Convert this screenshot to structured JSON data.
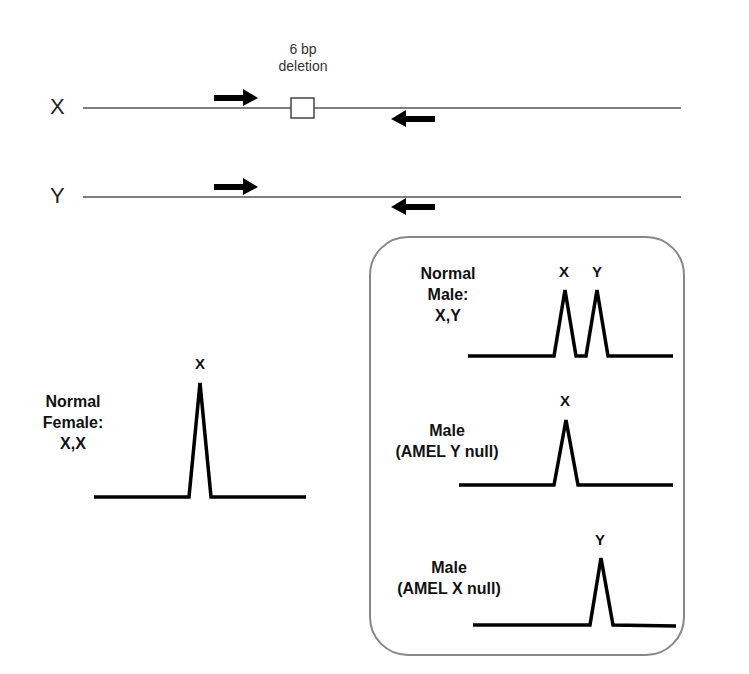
{
  "diagram": {
    "chromosomes": [
      {
        "label": "X",
        "has_deletion": true
      },
      {
        "label": "Y",
        "has_deletion": false
      }
    ],
    "deletion_label_line1": "6 bp",
    "deletion_label_line2": "deletion",
    "female": {
      "line1": "Normal",
      "line2": "Female:",
      "line3": "X,X",
      "peaks": [
        "X"
      ]
    },
    "panel": {
      "normal_male": {
        "line1": "Normal",
        "line2": "Male:",
        "line3": "X,Y",
        "peaks": [
          "X",
          "Y"
        ]
      },
      "y_null": {
        "line1": "Male",
        "line2": "(AMEL Y null)",
        "peaks": [
          "X"
        ]
      },
      "x_null": {
        "line1": "Male",
        "line2": "(AMEL X null)",
        "peaks": [
          "Y"
        ]
      }
    },
    "colors": {
      "line": "#555555",
      "ink": "#000000",
      "panel_border": "#888888"
    }
  }
}
